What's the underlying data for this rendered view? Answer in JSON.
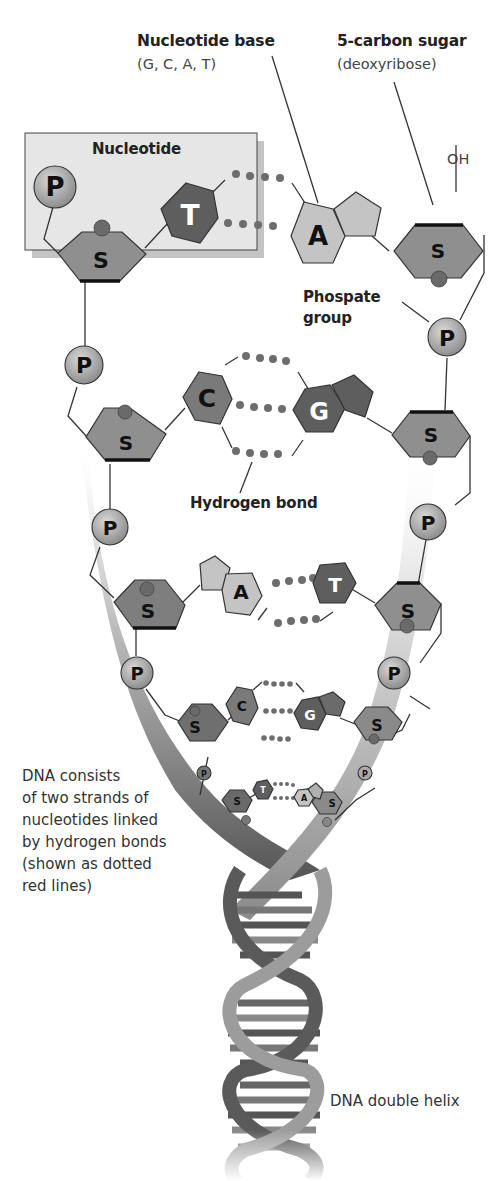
{
  "labels": {
    "nucleotide_base": "Nucleotide base",
    "nucleotide_base_sub": "(G, C, A, T)",
    "carbon_sugar": "5-carbon sugar",
    "carbon_sugar_sub": "(deoxyribose)",
    "nucleotide_box_title": "Nucleotide",
    "oh": "OH",
    "phosphate_line1": "Phospate",
    "phosphate_line2": "group",
    "hydrogen_bond": "Hydrogen bond",
    "description_lines": [
      "DNA consists",
      "of two strands of",
      "nucleotides linked",
      "by hydrogen bonds",
      "(shown as dotted",
      "red lines)"
    ],
    "double_helix": "DNA double helix"
  },
  "glyphs": {
    "phosphate": "P",
    "sugar": "S",
    "thymine": "T",
    "adenine": "A",
    "cytosine": "C",
    "guanine": "G"
  },
  "base_pairs": [
    {
      "left": "T",
      "right": "A",
      "bonds": 2
    },
    {
      "left": "C",
      "right": "G",
      "bonds": 3
    },
    {
      "left": "A",
      "right": "T",
      "bonds": 2
    },
    {
      "left": "C",
      "right": "G",
      "bonds": 3
    },
    {
      "left": "T",
      "right": "A",
      "bonds": 2
    }
  ],
  "colors": {
    "box_fill": "#e6e6e6",
    "phosphate": "#a9a9a9",
    "sugar": "#8f8f8f",
    "dark_base": "#5e5e5e",
    "light_base": "#c4c4c4",
    "hbond_dot": "#6d6d6d",
    "strand_ribbon": "#9a9a9a",
    "line": "#333333"
  }
}
